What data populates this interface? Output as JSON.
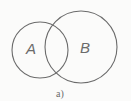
{
  "diagram": {
    "type": "venn",
    "caption": "a)",
    "stroke_color": "#6b6b6b",
    "background": "#fbfbfa",
    "sets": [
      {
        "label": "A",
        "cx": 40,
        "cy": 50,
        "r": 28
      },
      {
        "label": "B",
        "cx": 81,
        "cy": 47,
        "r": 36
      }
    ]
  }
}
